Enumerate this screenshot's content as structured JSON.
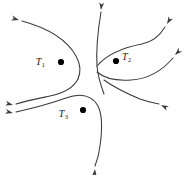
{
  "figure": {
    "type": "vector-field-separatrix-diagram",
    "background_color": "#ffffff",
    "curve_color": "#3a3a3a",
    "dot_color": "#000000",
    "label_color": "#1a1a1a",
    "width": 188,
    "height": 175
  },
  "nodes": [
    {
      "id": "T1",
      "base": "T",
      "subscript": "1",
      "dot_x": 61,
      "dot_y": 62,
      "dot_r": 3.1,
      "label_x": 45,
      "label_y": 65,
      "label_side": "left"
    },
    {
      "id": "T2",
      "base": "T",
      "subscript": "2",
      "dot_x": 116,
      "dot_y": 61,
      "dot_r": 3.1,
      "label_x": 122,
      "label_y": 60,
      "label_side": "right"
    },
    {
      "id": "T3",
      "base": "T",
      "subscript": "3",
      "dot_x": 83,
      "dot_y": 110,
      "dot_r": 3.1,
      "label_x": 68,
      "label_y": 117,
      "label_side": "left"
    }
  ],
  "curves": [
    {
      "name": "left-hyperbola-upper",
      "path": "M 22 21 C 44 27, 66 38, 76 56 C 81 65, 81 72, 78 79"
    },
    {
      "name": "left-hyperbola-lower",
      "path": "M 78 79 C 74 87, 64 93, 50 96 C 36 99, 26 101, 16 104"
    },
    {
      "name": "center-vertical-separatrix",
      "path": "M 101 12 C 98 30, 96 50, 97 66 C 98 78, 101 86, 104 94"
    },
    {
      "name": "t2-hyperbola-upper",
      "path": "M 97 66 C 108 53, 126 47, 142 44 C 152 42, 159 37, 165 27"
    },
    {
      "name": "t2-hyperbola-lower",
      "path": "M 97 72 C 104 78, 117 81, 131 80 C 147 79, 161 72, 173 58"
    },
    {
      "name": "t2-outflow-right",
      "path": "M 104 80 C 115 88, 128 94, 140 99 C 148 102, 153 103, 159 104"
    },
    {
      "name": "t3-loop",
      "path": "M 16 112 C 34 108, 52 103, 66 98 C 80 93, 92 95, 98 106 C 103 116, 102 132, 100 146 C 99 155, 97 161, 95 166"
    }
  ],
  "arrows": [
    {
      "name": "arrow-upper-left",
      "x": 19,
      "y": 20,
      "angle": 195
    },
    {
      "name": "arrow-top-center",
      "x": 101,
      "y": 10,
      "angle": 275
    },
    {
      "name": "arrow-top-right",
      "x": 167,
      "y": 24,
      "angle": 300
    },
    {
      "name": "arrow-mid-right",
      "x": 175,
      "y": 55,
      "angle": 315
    },
    {
      "name": "arrow-lower-right",
      "x": 161,
      "y": 105,
      "angle": 28
    },
    {
      "name": "arrow-mid-left",
      "x": 13,
      "y": 105,
      "angle": 194
    },
    {
      "name": "arrow-lower-left",
      "x": 13,
      "y": 113,
      "angle": 192
    },
    {
      "name": "arrow-bottom-center",
      "x": 95,
      "y": 169,
      "angle": 95
    }
  ]
}
